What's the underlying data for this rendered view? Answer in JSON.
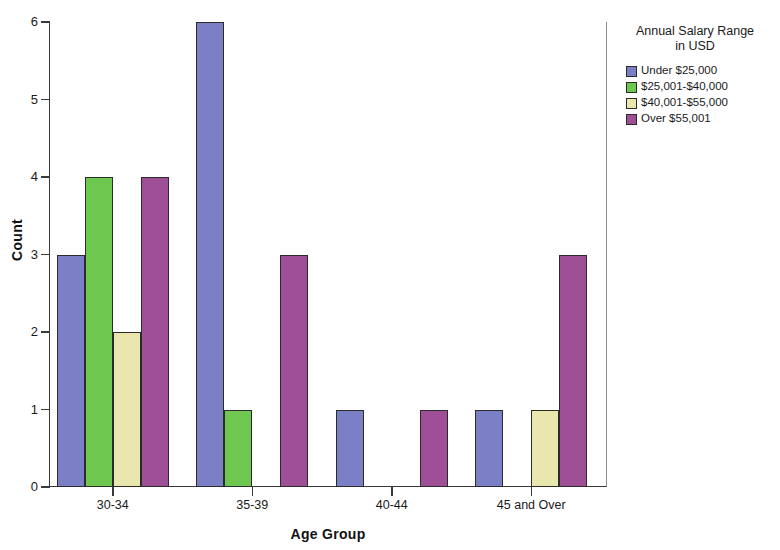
{
  "chart_data": {
    "type": "bar",
    "title": "",
    "xlabel": "Age Group",
    "ylabel": "Count",
    "categories": [
      "30-34",
      "35-39",
      "40-44",
      "45 and Over"
    ],
    "series": [
      {
        "name": "Under $25,000",
        "color": "#7b7fc6",
        "values": [
          3,
          6,
          1,
          1
        ]
      },
      {
        "name": "$25,001-$40,000",
        "color": "#6ec84f",
        "values": [
          4,
          1,
          0,
          0
        ]
      },
      {
        "name": "$40,001-$55,000",
        "color": "#eae7ae",
        "values": [
          2,
          0,
          0,
          1
        ]
      },
      {
        "name": "Over $55,001",
        "color": "#9f4f96",
        "values": [
          4,
          3,
          1,
          3
        ]
      }
    ],
    "ylim": [
      0,
      6
    ],
    "yticks": [
      0,
      1,
      2,
      3,
      4,
      5,
      6
    ],
    "ytick_labels": [
      "0",
      "1",
      "2",
      "3",
      "4",
      "5",
      "6"
    ],
    "grid": false,
    "legend_position": "right",
    "legend_title": "Annual Salary Range\nin USD"
  },
  "legend": {
    "title_line1": "Annual Salary Range",
    "title_line2": "in USD"
  },
  "axes": {
    "y_title": "Count",
    "x_title": "Age Group"
  }
}
